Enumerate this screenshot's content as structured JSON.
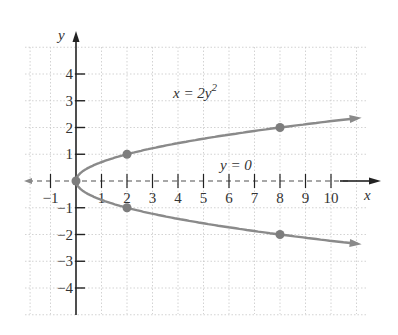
{
  "chart_data": {
    "type": "line",
    "title": "",
    "xlabel": "x",
    "ylabel": "y",
    "xlim": [
      -1.5,
      11.5
    ],
    "ylim": [
      -5,
      5
    ],
    "grid": true,
    "x_ticks": [
      "-1",
      "1",
      "2",
      "3",
      "4",
      "5",
      "6",
      "7",
      "8",
      "9",
      "10"
    ],
    "y_ticks": [
      "4",
      "3",
      "2",
      "1",
      "-1",
      "-2",
      "-3",
      "-4"
    ],
    "series": [
      {
        "name": "x = 2y^2",
        "kind": "parabola opening right",
        "points": [
          [
            0,
            0
          ],
          [
            2,
            1
          ],
          [
            2,
            -1
          ],
          [
            8,
            2
          ],
          [
            8,
            -2
          ]
        ],
        "color": "#888888"
      },
      {
        "name": "y = 0",
        "kind": "dashed horizontal line (axis of symmetry)",
        "color": "#888888"
      }
    ],
    "annotations": [
      {
        "text": "x = 2y²",
        "x": 4.5,
        "y": 3
      },
      {
        "text": "y = 0",
        "x": 6,
        "y": 0.5
      }
    ]
  },
  "labels": {
    "x_axis": "x",
    "y_axis": "y",
    "equation_main": "x = 2y",
    "equation_exp": "2",
    "equation_line": "y = 0"
  },
  "colors": {
    "axis": "#222222",
    "curve": "#8a8a8a",
    "grid": "#c8c8c8",
    "point": "#7d7d7d"
  }
}
